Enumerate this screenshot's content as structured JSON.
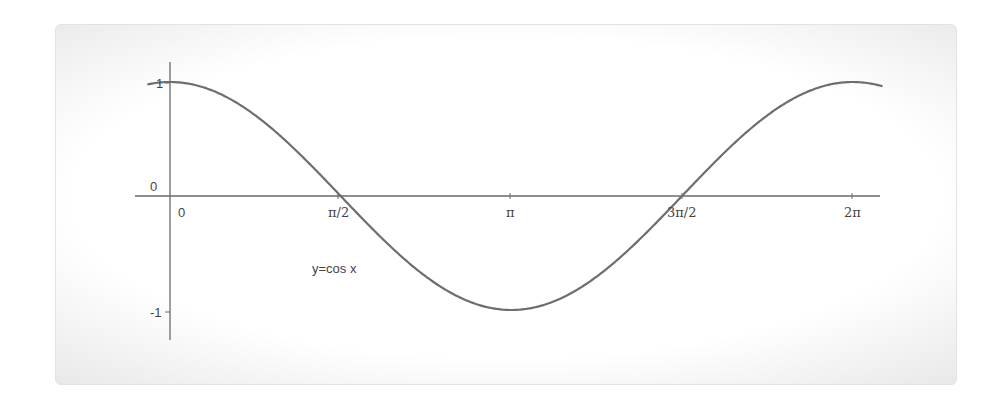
{
  "chart_data": {
    "type": "line",
    "title": "",
    "xlabel": "",
    "ylabel": "",
    "annotation": "y=cos x",
    "function": "cos(x)",
    "x_ticks": [
      {
        "label": "0",
        "value": 0
      },
      {
        "label": "π/2",
        "value": 1.5708
      },
      {
        "label": "π",
        "value": 3.1416
      },
      {
        "label": "3π/2",
        "value": 4.7124
      },
      {
        "label": "2π",
        "value": 6.2832
      }
    ],
    "y_ticks": [
      {
        "label": "1",
        "value": 1
      },
      {
        "label": "0",
        "value": 0
      },
      {
        "label": "-1",
        "value": -1
      }
    ],
    "xlim": [
      -0.2,
      6.55
    ],
    "ylim": [
      -1.2,
      1.1
    ],
    "grid": false,
    "series": [
      {
        "name": "y=cos x",
        "x": [
          -0.2,
          0,
          0.785,
          1.571,
          2.356,
          3.142,
          3.927,
          4.712,
          5.498,
          6.283,
          6.55
        ],
        "values": [
          0.98,
          1,
          0.707,
          0,
          -0.707,
          -1,
          -0.707,
          0,
          0.707,
          1,
          0.965
        ]
      }
    ],
    "line_color": "#6e6e6e"
  },
  "labels": {
    "curve_label": "y=cos x",
    "y_tick_1": "1",
    "y_tick_0": "0",
    "y_tick_neg1": "-1",
    "x_tick_0": "0",
    "x_tick_pi_2": "π/2",
    "x_tick_pi": "π",
    "x_tick_3pi_2": "3π/2",
    "x_tick_2pi": "2π"
  }
}
